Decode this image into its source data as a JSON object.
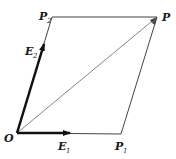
{
  "diagram": {
    "colors": {
      "line": "#444444",
      "vector": "#111111",
      "text": "#1a1a1a"
    },
    "points": {
      "O": {
        "label": "O",
        "x": 17,
        "y": 133
      },
      "P1": {
        "label": "P",
        "sub": "1",
        "x": 121,
        "y": 134
      },
      "P2": {
        "label": "P",
        "sub": "2",
        "x": 52,
        "y": 17
      },
      "P": {
        "label": "P",
        "x": 157,
        "y": 17
      }
    },
    "vectors": {
      "E1": {
        "label": "E",
        "sub": "1"
      },
      "E2": {
        "label": "E",
        "sub": "2"
      }
    }
  }
}
